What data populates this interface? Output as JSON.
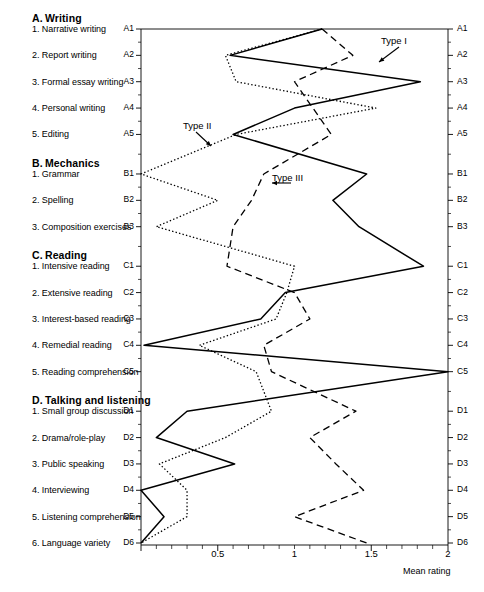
{
  "figure": {
    "axis_title": "Mean rating",
    "x_ticks": [
      "0.5",
      "1",
      "1.5",
      "2"
    ],
    "series_labels": {
      "type1": "Type I",
      "type2": "Type II",
      "type3": "Type III"
    }
  },
  "sections": [
    {
      "key": "A",
      "heading_letter": "A.",
      "heading_text": "Writing",
      "items": [
        {
          "num": "1.",
          "text": "Narrative writing",
          "code": "A1"
        },
        {
          "num": "2.",
          "text": "Report writing",
          "code": "A2"
        },
        {
          "num": "3.",
          "text": "Formal essay writing",
          "code": "A3"
        },
        {
          "num": "4.",
          "text": "Personal writing",
          "code": "A4"
        },
        {
          "num": "5.",
          "text": "Editing",
          "code": "A5"
        }
      ]
    },
    {
      "key": "B",
      "heading_letter": "B.",
      "heading_text": "Mechanics",
      "items": [
        {
          "num": "1.",
          "text": "Grammar",
          "code": "B1"
        },
        {
          "num": "2.",
          "text": "Spelling",
          "code": "B2"
        },
        {
          "num": "3.",
          "text": "Composition exercises",
          "code": "B3"
        }
      ]
    },
    {
      "key": "C",
      "heading_letter": "C.",
      "heading_text": "Reading",
      "items": [
        {
          "num": "1.",
          "text": "Intensive reading",
          "code": "C1"
        },
        {
          "num": "2.",
          "text": "Extensive reading",
          "code": "C2"
        },
        {
          "num": "3.",
          "text": "Interest-based reading",
          "code": "C3"
        },
        {
          "num": "4.",
          "text": "Remedial reading",
          "code": "C4"
        },
        {
          "num": "5.",
          "text": "Reading comprehension",
          "code": "C5"
        }
      ]
    },
    {
      "key": "D",
      "heading_letter": "D.",
      "heading_text": "Talking and listening",
      "items": [
        {
          "num": "1.",
          "text": "Small group discussion",
          "code": "D1"
        },
        {
          "num": "2.",
          "text": "Drama/role-play",
          "code": "D2"
        },
        {
          "num": "3.",
          "text": "Public speaking",
          "code": "D3"
        },
        {
          "num": "4.",
          "text": "Interviewing",
          "code": "D4"
        },
        {
          "num": "5.",
          "text": "Listening comprehension",
          "code": "D5"
        },
        {
          "num": "6.",
          "text": "Language variety",
          "code": "D6"
        }
      ]
    }
  ],
  "chart_data": {
    "type": "line",
    "orientation": "horizontal",
    "title": "",
    "xlabel": "Mean rating",
    "ylabel": "",
    "xlim": [
      0,
      2
    ],
    "xticks": [
      0,
      0.5,
      1,
      1.5,
      2
    ],
    "xtick_labels": [
      "",
      "0.5",
      "1",
      "1.5",
      "2"
    ],
    "x_minor_ticks": 0.1,
    "grid": false,
    "legend": "inline-annotations",
    "categories": [
      "A1",
      "A2",
      "A3",
      "A4",
      "A5",
      "B1",
      "B2",
      "B3",
      "C1",
      "C2",
      "C3",
      "C4",
      "C5",
      "D1",
      "D2",
      "D3",
      "D4",
      "D5",
      "D6"
    ],
    "category_labels": [
      "Narrative writing",
      "Report writing",
      "Formal essay writing",
      "Personal writing",
      "Editing",
      "Grammar",
      "Spelling",
      "Composition exercises",
      "Intensive reading",
      "Extensive reading",
      "Interest-based reading",
      "Remedial reading",
      "Reading comprehension",
      "Small group discussion",
      "Drama/role-play",
      "Public speaking",
      "Interviewing",
      "Listening comprehension",
      "Language variety"
    ],
    "series": [
      {
        "name": "Type I",
        "style": "solid",
        "color": "#000000",
        "values": [
          1.18,
          0.58,
          1.82,
          1.0,
          0.6,
          1.47,
          1.25,
          1.42,
          1.84,
          0.94,
          0.78,
          0.02,
          2.0,
          0.3,
          0.1,
          0.61,
          0.0,
          0.15,
          0.0
        ]
      },
      {
        "name": "Type II",
        "style": "dotted",
        "color": "#000000",
        "values": [
          1.18,
          0.55,
          0.62,
          1.53,
          0.62,
          0.0,
          0.5,
          0.1,
          1.0,
          0.95,
          0.88,
          0.38,
          0.75,
          0.85,
          0.55,
          0.12,
          0.3,
          0.3,
          0.0
        ]
      },
      {
        "name": "Type III",
        "style": "dashed",
        "color": "#000000",
        "values": [
          1.18,
          1.38,
          1.0,
          1.12,
          1.24,
          0.8,
          0.72,
          0.6,
          0.56,
          1.0,
          1.1,
          0.8,
          0.85,
          1.4,
          1.1,
          1.27,
          1.45,
          1.0,
          1.47
        ]
      }
    ],
    "annotations": [
      {
        "text": "Type I",
        "series": "Type I"
      },
      {
        "text": "Type II",
        "series": "Type II"
      },
      {
        "text": "Type III",
        "series": "Type III"
      }
    ]
  }
}
